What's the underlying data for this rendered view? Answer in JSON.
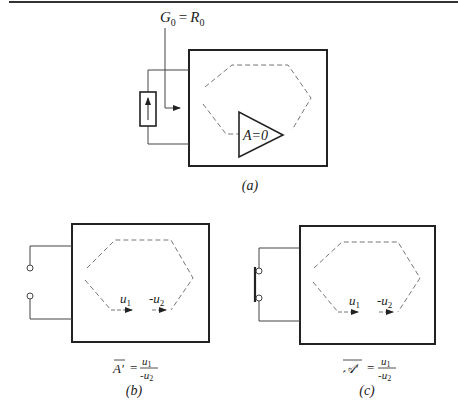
{
  "figure": {
    "colors": {
      "ink": "#222222",
      "wire": "#444444",
      "dashed": "#777777",
      "background": "#ffffff"
    },
    "panel_a": {
      "caption": "(a)",
      "top_label": {
        "G": "G",
        "G_sub": "0",
        "eq": "=",
        "R": "R",
        "R_sub": "0"
      },
      "amplifier_label": "A=0",
      "source_icon": "current-source-arrow-up"
    },
    "panel_b": {
      "caption": "(b)",
      "arrow1_label": {
        "base": "u",
        "sub": "1"
      },
      "arrow2_label": {
        "prefix": "-",
        "base": "u",
        "sub": "2"
      },
      "formula": {
        "lhs": "A'",
        "eq": "=",
        "num": "u",
        "num_sub": "1",
        "den": "-u",
        "den_sub": "2"
      },
      "port": "open-circuit"
    },
    "panel_c": {
      "caption": "(c)",
      "arrow1_label": {
        "base": "u",
        "sub": "1"
      },
      "arrow2_label": {
        "prefix": "-",
        "base": "u",
        "sub": "2"
      },
      "formula": {
        "lhs": "𝒜'",
        "eq": "=",
        "num": "u",
        "num_sub": "1",
        "den": "-u",
        "den_sub": "2"
      },
      "port": "short-circuit"
    }
  }
}
